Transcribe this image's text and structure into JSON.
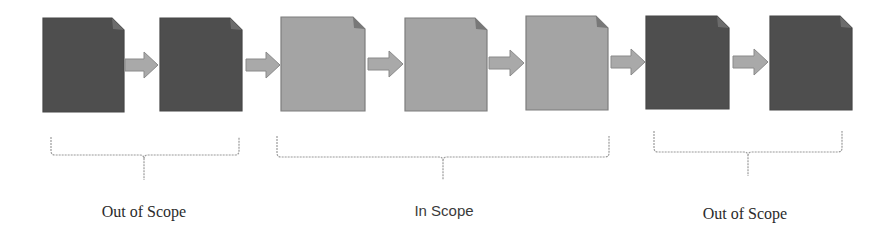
{
  "diagram": {
    "colors": {
      "out_of_scope_doc": "#4e4e4e",
      "out_of_scope_fold": "#6c6c6c",
      "in_scope_doc": "#a4a4a4",
      "in_scope_border": "#7d7d7d",
      "in_scope_fold": "#787878",
      "arrow_fill": "#a9a9a9",
      "arrow_stroke": "#8a8a8a",
      "brace": "#9a9a9a"
    },
    "documents": [
      {
        "id": 1,
        "scope": "out",
        "x": 43,
        "y": 18,
        "w": 81,
        "h": 94
      },
      {
        "id": 2,
        "scope": "out",
        "x": 160,
        "y": 18,
        "w": 82,
        "h": 93
      },
      {
        "id": 3,
        "scope": "in",
        "x": 281,
        "y": 17,
        "w": 84,
        "h": 94
      },
      {
        "id": 4,
        "scope": "in",
        "x": 405,
        "y": 18,
        "w": 82,
        "h": 93
      },
      {
        "id": 5,
        "scope": "in",
        "x": 526,
        "y": 16,
        "w": 82,
        "h": 94
      },
      {
        "id": 6,
        "scope": "out",
        "x": 646,
        "y": 16,
        "w": 83,
        "h": 93
      },
      {
        "id": 7,
        "scope": "out",
        "x": 770,
        "y": 16,
        "w": 82,
        "h": 94
      }
    ],
    "arrows": [
      {
        "from": 1,
        "to": 2,
        "x1": 125,
        "x2": 158,
        "cy": 65
      },
      {
        "from": 2,
        "to": 3,
        "x1": 246,
        "x2": 280,
        "cy": 65
      },
      {
        "from": 3,
        "to": 4,
        "x1": 368,
        "x2": 403,
        "cy": 64
      },
      {
        "from": 4,
        "to": 5,
        "x1": 489,
        "x2": 524,
        "cy": 63
      },
      {
        "from": 5,
        "to": 6,
        "x1": 611,
        "x2": 645,
        "cy": 62
      },
      {
        "from": 6,
        "to": 7,
        "x1": 733,
        "x2": 768,
        "cy": 62
      }
    ],
    "groups": [
      {
        "label": "Out of Scope",
        "font": "serif",
        "brace": {
          "x1": 51,
          "x2": 239,
          "top": 137,
          "mid": 155,
          "tip": 180,
          "cx": 144
        },
        "label_x": 144,
        "label_y": 203
      },
      {
        "label": "In Scope",
        "font": "sans",
        "brace": {
          "x1": 277,
          "x2": 609,
          "top": 136,
          "mid": 157,
          "tip": 180,
          "cx": 443
        },
        "label_x": 444,
        "label_y": 202
      },
      {
        "label": "Out of Scope",
        "font": "serif",
        "brace": {
          "x1": 654,
          "x2": 842,
          "top": 131,
          "mid": 152,
          "tip": 176,
          "cx": 748
        },
        "label_x": 745,
        "label_y": 205
      }
    ]
  }
}
